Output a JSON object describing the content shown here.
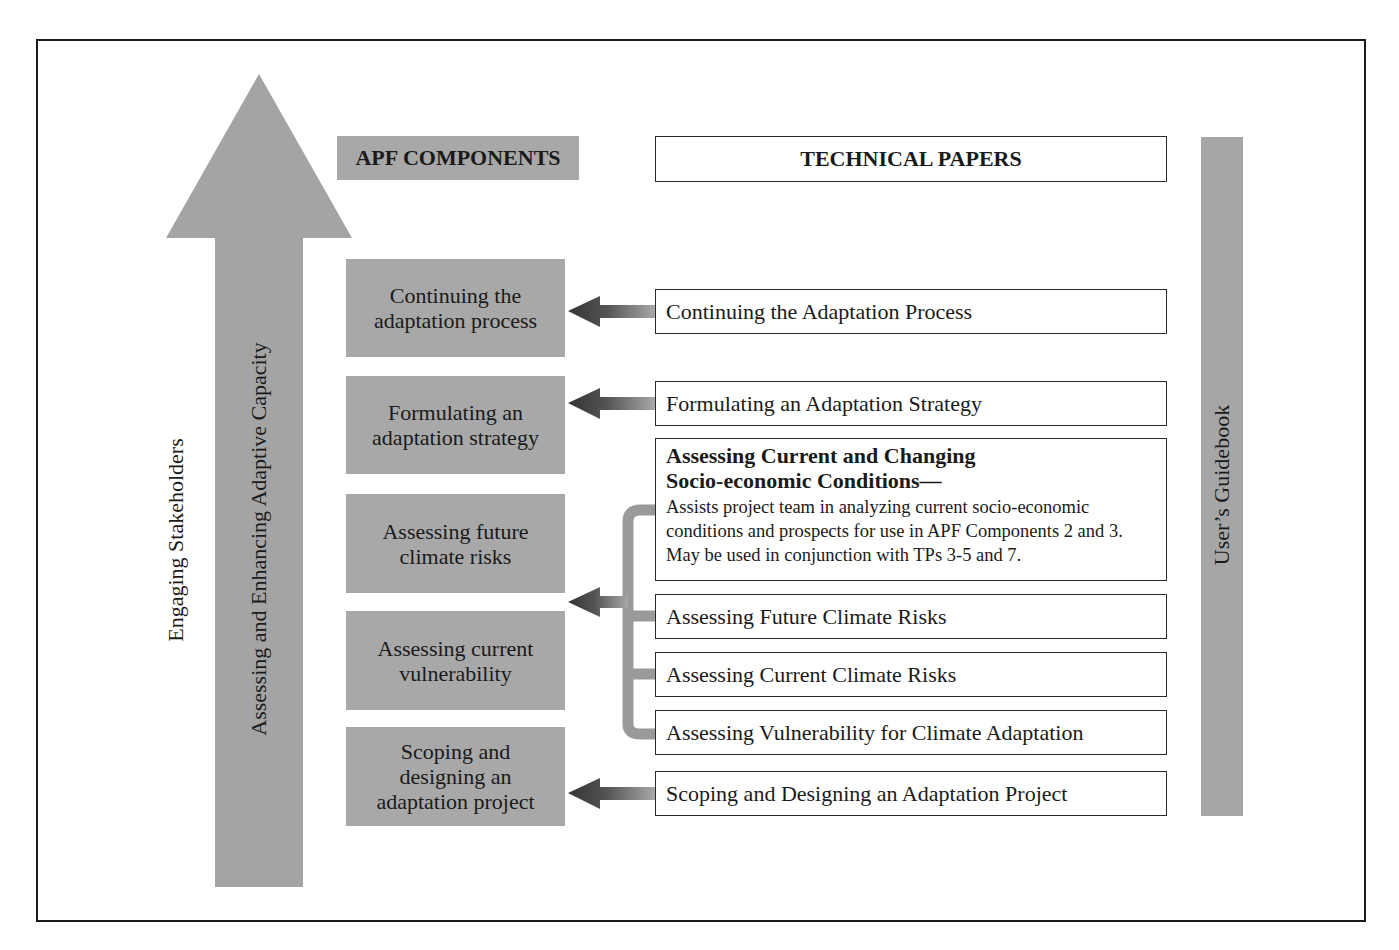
{
  "diagram": {
    "big_arrow": {
      "outer_label": "Engaging Stakeholders",
      "inner_label": "Assessing and Enhancing Adaptive Capacity"
    },
    "headers": {
      "components": "APF COMPONENTS",
      "technical_papers": "TECHNICAL PAPERS"
    },
    "components": [
      {
        "label": "Continuing the adaptation process"
      },
      {
        "label": "Formulating an adaptation strategy"
      },
      {
        "label": "Assessing future climate risks"
      },
      {
        "label": "Assessing current vulnerability"
      },
      {
        "label": "Scoping and designing an adaptation project"
      }
    ],
    "technical_papers": [
      {
        "label": "Continuing the Adaptation Process"
      },
      {
        "label": "Formulating an Adaptation Strategy"
      },
      {
        "label": "Assessing Current and Changing Socio-economic Conditions—",
        "description": "Assists project team in analyzing current socio-economic conditions and prospects for use in APF Components 2 and 3. May be used in conjunction with TPs 3-5 and 7."
      },
      {
        "label": "Assessing Future Climate Risks"
      },
      {
        "label": "Assessing Current Climate Risks"
      },
      {
        "label": "Assessing Vulnerability for Climate Adaptation"
      },
      {
        "label": "Scoping and Designing an Adaptation Project"
      }
    ],
    "side_bar": {
      "label": "User’s Guidebook"
    },
    "colors": {
      "gray_fill": "#a8a8a8",
      "dark_arrow": "#3a3a3a",
      "border": "#1a1a1a"
    }
  }
}
